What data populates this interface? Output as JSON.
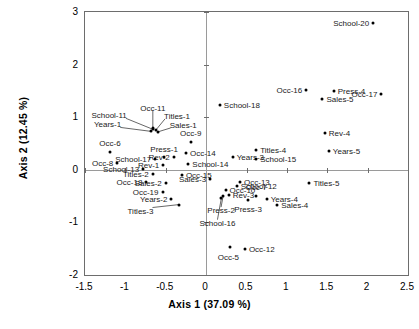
{
  "chart_data": {
    "type": "scatter",
    "title": "",
    "xlabel": "Axis 1 (37.09 %)",
    "ylabel": "Axis 2 (12.45 %)",
    "xlim": [
      -1.5,
      2.5
    ],
    "ylim": [
      -2,
      3
    ],
    "xticks": [
      -1.5,
      -1,
      -0.5,
      0,
      0.5,
      1,
      1.5,
      2,
      2.5
    ],
    "xtick_labels": [
      "-1.5",
      "-1",
      "-0.5",
      "0",
      "0.5",
      "1",
      "1.5",
      "2",
      "2.5"
    ],
    "yticks": [
      -2,
      -1,
      0,
      1,
      2,
      3
    ],
    "ytick_labels": [
      "-2",
      "-1",
      "0",
      "1",
      "2",
      "3"
    ],
    "grid": false,
    "legend": "none",
    "zero_lines": true,
    "points": [
      {
        "label": "School-20",
        "x": 2.07,
        "y": 2.79,
        "pos": "l"
      },
      {
        "label": "Occ-16",
        "x": 1.24,
        "y": 1.52,
        "pos": "l"
      },
      {
        "label": "Press-4",
        "x": 1.58,
        "y": 1.5,
        "pos": "r"
      },
      {
        "label": "Occ-17",
        "x": 2.17,
        "y": 1.44,
        "pos": "l"
      },
      {
        "label": "Sales-5",
        "x": 1.44,
        "y": 1.34,
        "pos": "r"
      },
      {
        "label": "School-18",
        "x": 0.17,
        "y": 1.24,
        "pos": "r"
      },
      {
        "label": "Occ-11",
        "x": -0.66,
        "y": 0.8,
        "pos": "c",
        "label_dx": 0,
        "label_dy": -20,
        "leader": true
      },
      {
        "label": "School-11",
        "x": -0.66,
        "y": 0.77,
        "pos": "l",
        "label_dx": -26,
        "label_dy": -14,
        "leader": true
      },
      {
        "label": "Titles-1",
        "x": -0.62,
        "y": 0.76,
        "pos": "r",
        "label_dx": 8,
        "label_dy": -14,
        "leader": true
      },
      {
        "label": "Years-1",
        "x": -0.68,
        "y": 0.73,
        "pos": "l",
        "label_dx": -30,
        "label_dy": -7,
        "leader": true
      },
      {
        "label": "Sales-1",
        "x": -0.6,
        "y": 0.72,
        "pos": "r",
        "label_dx": 12,
        "label_dy": -7,
        "leader": true
      },
      {
        "label": "Rev-4",
        "x": 1.47,
        "y": 0.7,
        "pos": "r"
      },
      {
        "label": "Occ-9",
        "x": -0.19,
        "y": 0.52,
        "pos": "c",
        "label_dx": 0,
        "label_dy": -9
      },
      {
        "label": "Years-5",
        "x": 1.52,
        "y": 0.36,
        "pos": "r"
      },
      {
        "label": "Occ-6",
        "x": -1.19,
        "y": 0.33,
        "pos": "c",
        "label_dx": 0,
        "label_dy": -9
      },
      {
        "label": "Titles-4",
        "x": 0.62,
        "y": 0.38,
        "pos": "r"
      },
      {
        "label": "Occ-14",
        "x": -0.25,
        "y": 0.31,
        "pos": "r"
      },
      {
        "label": "Years-3",
        "x": 0.33,
        "y": 0.25,
        "pos": "r"
      },
      {
        "label": "School-15",
        "x": 0.62,
        "y": 0.21,
        "pos": "r"
      },
      {
        "label": "Press-1",
        "x": -0.52,
        "y": 0.25,
        "pos": "c",
        "label_dx": 0,
        "label_dy": -8
      },
      {
        "label": "Rev-2",
        "x": -0.4,
        "y": 0.24,
        "pos": "l"
      },
      {
        "label": "School-17",
        "x": -0.63,
        "y": 0.2,
        "pos": "l"
      },
      {
        "label": "Occ-8",
        "x": -1.1,
        "y": 0.13,
        "pos": "l"
      },
      {
        "label": "Rev-1",
        "x": -0.53,
        "y": 0.09,
        "pos": "l"
      },
      {
        "label": "School-14",
        "x": -0.22,
        "y": 0.11,
        "pos": "r"
      },
      {
        "label": "School-13",
        "x": -0.78,
        "y": 0.01,
        "pos": "l"
      },
      {
        "label": "Titles-2",
        "x": -0.66,
        "y": -0.08,
        "pos": "l"
      },
      {
        "label": "Occ-15",
        "x": -0.3,
        "y": -0.1,
        "pos": "r"
      },
      {
        "label": "Sales-3",
        "x": 0.05,
        "y": -0.17,
        "pos": "l"
      },
      {
        "label": "Occ-13",
        "x": 0.42,
        "y": -0.23,
        "pos": "r"
      },
      {
        "label": "Titles-5",
        "x": 1.28,
        "y": -0.26,
        "pos": "r"
      },
      {
        "label": "Occ-18",
        "x": -0.74,
        "y": -0.24,
        "pos": "l"
      },
      {
        "label": "Sales-2",
        "x": -0.5,
        "y": -0.25,
        "pos": "l"
      },
      {
        "label": "School-12",
        "x": 0.38,
        "y": -0.3,
        "pos": "r"
      },
      {
        "label": "Occ-10",
        "x": 0.24,
        "y": -0.38,
        "pos": "r"
      },
      {
        "label": "Occ-19",
        "x": -0.54,
        "y": -0.42,
        "pos": "l"
      },
      {
        "label": "Rev-3",
        "x": 0.28,
        "y": -0.47,
        "pos": "r"
      },
      {
        "label": "Occ-7",
        "x": 0.62,
        "y": -0.49,
        "pos": "c",
        "label_dx": 0,
        "label_dy": -9
      },
      {
        "label": "Years-4",
        "x": 0.75,
        "y": -0.55,
        "pos": "r"
      },
      {
        "label": "Years-2",
        "x": -0.43,
        "y": -0.55,
        "pos": "l"
      },
      {
        "label": "Press-2",
        "x": 0.21,
        "y": -0.5,
        "pos": "c",
        "label_dx": -2,
        "label_dy": 14,
        "leader": true
      },
      {
        "label": "Press-3",
        "x": 0.52,
        "y": -0.57,
        "pos": "c",
        "label_dx": 0,
        "label_dy": 9
      },
      {
        "label": "Titles-3",
        "x": -0.33,
        "y": -0.66,
        "pos": "l",
        "label_dx": -26,
        "label_dy": 6,
        "leader": true
      },
      {
        "label": "Sales-4",
        "x": 0.88,
        "y": -0.67,
        "pos": "r"
      },
      {
        "label": "School-16",
        "x": 0.19,
        "y": -0.53,
        "pos": "c",
        "label_dx": -4,
        "label_dy": 25,
        "leader": true
      },
      {
        "label": "Occ-5",
        "x": 0.3,
        "y": -1.47,
        "pos": "c",
        "label_dx": -2,
        "label_dy": 10
      },
      {
        "label": "Occ-12",
        "x": 0.48,
        "y": -1.5,
        "pos": "r"
      }
    ]
  },
  "caption": ""
}
